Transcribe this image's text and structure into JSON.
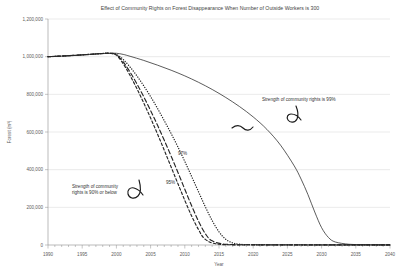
{
  "chart_data": {
    "type": "line",
    "title": "Effect of Community Rights on Forest Disappearance When Number of Outside Workers is 300",
    "xlabel": "Year",
    "ylabel": "Forest (m³)",
    "xlim": [
      1990,
      2040
    ],
    "ylim": [
      0,
      1200000
    ],
    "xticks": [
      "1990",
      "1995",
      "2000",
      "2005",
      "2010",
      "2015",
      "2020",
      "2025",
      "2030",
      "2035",
      "2040"
    ],
    "xtick_values": [
      1990,
      1995,
      2000,
      2005,
      2010,
      2015,
      2020,
      2025,
      2030,
      2035,
      2040
    ],
    "yticks": [
      "0",
      "200,000",
      "400,000",
      "600,000",
      "800,000",
      "1,000,000",
      "1,200,000"
    ],
    "ytick_values": [
      0,
      200000,
      400000,
      600000,
      800000,
      1000000,
      1200000
    ],
    "grid": "horizontal",
    "legend_position": "none",
    "annotations": [
      {
        "name": "annotation-99",
        "text": "Strength of community rights is 99%",
        "x": 262,
        "y": 101
      },
      {
        "name": "annotation-90-line1",
        "text": "Strength of community",
        "x": 72,
        "y": 188
      },
      {
        "name": "annotation-90-line2",
        "text": "rights is 90% or below",
        "x": 72,
        "y": 194
      },
      {
        "name": "series-label-97",
        "text": "97%",
        "x": 178,
        "y": 155
      },
      {
        "name": "series-label-95",
        "text": "95%",
        "x": 166,
        "y": 184
      }
    ],
    "series": [
      {
        "name": "Strength of community rights is 99%",
        "style": "solid",
        "x": [
          1990,
          1992,
          1994,
          1996,
          1998,
          1999,
          2000,
          2001,
          2002,
          2004,
          2006,
          2008,
          2010,
          2012,
          2014,
          2016,
          2018,
          2020,
          2022,
          2024,
          2026,
          2027,
          2028,
          2029,
          2030,
          2031,
          2032,
          2034,
          2036,
          2038,
          2040
        ],
        "y": [
          1000000,
          1003000,
          1007000,
          1012000,
          1016000,
          1018000,
          1018000,
          1012000,
          1002000,
          980000,
          955000,
          928000,
          898000,
          864000,
          826000,
          783000,
          735000,
          680000,
          614000,
          530000,
          420000,
          350000,
          268000,
          175000,
          92000,
          40000,
          16000,
          4000,
          1500,
          800,
          500
        ]
      },
      {
        "name": "97%",
        "style": "dotted",
        "x": [
          1990,
          1993,
          1996,
          1998,
          1999,
          2000,
          2001,
          2002,
          2003,
          2004,
          2005,
          2006,
          2007,
          2008,
          2009,
          2010,
          2011,
          2012,
          2013,
          2014,
          2015,
          2016,
          2017,
          2018,
          2020,
          2025,
          2030,
          2035,
          2040
        ],
        "y": [
          1000000,
          1005000,
          1012000,
          1017000,
          1018000,
          1012000,
          985000,
          945000,
          898000,
          845000,
          788000,
          726000,
          660000,
          592000,
          520000,
          444000,
          364000,
          283000,
          203000,
          130000,
          70000,
          30000,
          11000,
          4000,
          1500,
          800,
          600,
          500,
          400
        ]
      },
      {
        "name": "95%",
        "style": "dashed-long",
        "x": [
          1990,
          1993,
          1996,
          1998,
          1999,
          2000,
          2001,
          2002,
          2003,
          2004,
          2005,
          2006,
          2007,
          2008,
          2009,
          2010,
          2011,
          2012,
          2013,
          2014,
          2016,
          2020,
          2025,
          2030,
          2035,
          2040
        ],
        "y": [
          1000000,
          1005000,
          1012000,
          1017000,
          1018000,
          1010000,
          972000,
          918000,
          855000,
          787000,
          714000,
          637000,
          556000,
          472000,
          385000,
          296000,
          208000,
          127000,
          60000,
          22000,
          4000,
          1200,
          800,
          600,
          500,
          400
        ]
      },
      {
        "name": "90% or below",
        "style": "dashed-short",
        "x": [
          1990,
          1993,
          1996,
          1998,
          1999,
          2000,
          2001,
          2002,
          2003,
          2004,
          2005,
          2006,
          2007,
          2008,
          2009,
          2010,
          2011,
          2012,
          2013,
          2015,
          2020,
          2025,
          2030,
          2035,
          2040
        ],
        "y": [
          1000000,
          1005000,
          1012000,
          1017000,
          1018000,
          1008000,
          962000,
          900000,
          830000,
          754000,
          674000,
          590000,
          503000,
          414000,
          325000,
          237000,
          154000,
          82000,
          30000,
          4000,
          1000,
          700,
          550,
          450,
          400
        ]
      }
    ]
  }
}
